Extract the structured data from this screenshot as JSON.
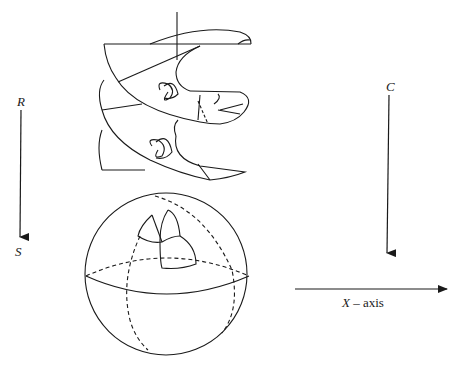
{
  "figure": {
    "labels": {
      "r": "R",
      "s": "S",
      "c": "C",
      "x_axis_var": "X",
      "x_axis_rest": " – axis"
    },
    "elements": [
      "helicoid-surface",
      "sphere",
      "r-to-s-arrow",
      "c-arrow",
      "x-axis-arrow"
    ],
    "colors": {
      "ink": "#1a1a1a",
      "background": "#ffffff"
    }
  }
}
